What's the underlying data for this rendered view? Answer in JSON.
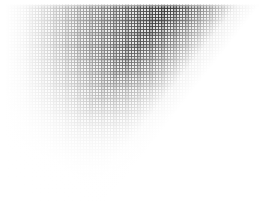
{
  "figure": {
    "width_px": 274,
    "height_px": 207,
    "paper_color": "#ffffff",
    "ink_color": "#000000"
  },
  "margins": {
    "top_px": 4,
    "right_px": 4,
    "bottom_px": 3,
    "left_px": 5
  },
  "grid": {
    "vertical_pitch_px": 3,
    "horizontal_pitch_px": 3,
    "vertical_rule_width_px": 1,
    "horizontal_rule_width_px": 1,
    "beat_vertical_pitch_px": 12,
    "beat_horizontal_pitch_px": 13
  },
  "density": {
    "max_corner": "top-right",
    "min_corner": "bottom-left",
    "darkest_value": "#0a0a0a",
    "lightest_value": "#ffffff",
    "horizontal_falloff": "left-light-to-right-dark",
    "vertical_falloff": "top-dark-to-bottom-light",
    "diagonal_cut_angle_deg": 128
  },
  "layers": [
    {
      "name": "ink-vertical",
      "kind": "ruling",
      "orientation": "vertical",
      "opacity": 0.94
    },
    {
      "name": "ink-horizontal",
      "kind": "ruling",
      "orientation": "horizontal",
      "opacity": 0.9
    },
    {
      "name": "ink-beat-v",
      "kind": "beat",
      "orientation": "vertical",
      "opacity": 0.3
    },
    {
      "name": "ink-beat-h",
      "kind": "beat",
      "orientation": "horizontal",
      "opacity": 0.26
    },
    {
      "name": "wash-horizontal",
      "kind": "wash",
      "orientation": "horizontal",
      "opacity": 1.0
    },
    {
      "name": "wash-vertical",
      "kind": "wash",
      "orientation": "vertical",
      "opacity": 1.0
    },
    {
      "name": "wash-diagonal",
      "kind": "wash",
      "orientation": "diagonal",
      "opacity": 1.0
    },
    {
      "name": "wash-corner",
      "kind": "wash",
      "orientation": "radial",
      "opacity": 1.0
    }
  ]
}
